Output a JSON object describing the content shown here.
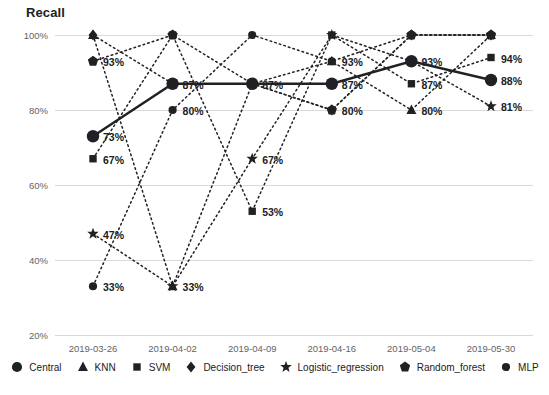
{
  "chart_data": {
    "type": "line",
    "title": "Recall",
    "xlabel": "",
    "ylabel": "",
    "ylim": [
      20,
      100
    ],
    "yticks": [
      "20%",
      "40%",
      "60%",
      "80%",
      "100%"
    ],
    "ytick_values": [
      20,
      40,
      60,
      80,
      100
    ],
    "grid": true,
    "legend_position": "bottom",
    "categories": [
      "2019-03-26",
      "2019-04-02",
      "2019-04-09",
      "2019-04-16",
      "2019-05-04",
      "2019-05-30"
    ],
    "series": [
      {
        "name": "Central",
        "marker": "circle",
        "line": "solid",
        "emphasis": true,
        "values": [
          73,
          87,
          87,
          87,
          93,
          88
        ],
        "labels": [
          "73%",
          "87%",
          "87%",
          "87%",
          "93%",
          "88%"
        ]
      },
      {
        "name": "KNN",
        "marker": "triangle",
        "line": "dotted",
        "emphasis": false,
        "values": [
          100,
          33,
          87,
          93,
          80,
          100
        ],
        "labels": [
          "",
          "",
          "",
          "",
          "80%",
          ""
        ]
      },
      {
        "name": "SVM",
        "marker": "square",
        "line": "dotted",
        "emphasis": false,
        "values": [
          67,
          100,
          53,
          100,
          87,
          94
        ],
        "labels": [
          "67%",
          "",
          "53%",
          "",
          "87%",
          "94%"
        ]
      },
      {
        "name": "Decision_tree",
        "marker": "diamond",
        "line": "dotted",
        "emphasis": false,
        "values": [
          100,
          87,
          87,
          80,
          100,
          100
        ],
        "labels": [
          "",
          "",
          "",
          "",
          "",
          ""
        ]
      },
      {
        "name": "Logistic_regression",
        "marker": "star",
        "line": "dotted",
        "emphasis": false,
        "values": [
          47,
          33,
          67,
          100,
          93,
          81
        ],
        "labels": [
          "47%",
          "33%",
          "67%",
          "",
          "",
          "81%"
        ]
      },
      {
        "name": "Random_forest",
        "marker": "pentagon",
        "line": "dotted",
        "emphasis": false,
        "values": [
          93,
          100,
          87,
          80,
          100,
          100
        ],
        "labels": [
          "93%",
          "",
          "",
          "80%",
          "",
          ""
        ]
      },
      {
        "name": "MLP",
        "marker": "circle-small",
        "line": "dotted",
        "emphasis": false,
        "values": [
          33,
          80,
          100,
          93,
          100,
          100
        ],
        "labels": [
          "33%",
          "80%",
          "",
          "93%",
          "",
          ""
        ]
      }
    ],
    "annotations": [
      {
        "text": "100%",
        "axis": "y"
      },
      {
        "text": "80%",
        "axis": "y"
      },
      {
        "text": "60%",
        "axis": "y"
      },
      {
        "text": "40%",
        "axis": "y"
      },
      {
        "text": "20%",
        "axis": "y"
      }
    ]
  },
  "colors": {
    "ink": "#202124",
    "grid": "#d9d9d9",
    "tick_text": "#5f6368",
    "background": "#ffffff"
  },
  "legend": {
    "items": [
      {
        "label": "Central",
        "marker": "circle"
      },
      {
        "label": "KNN",
        "marker": "triangle"
      },
      {
        "label": "SVM",
        "marker": "square"
      },
      {
        "label": "Decision_tree",
        "marker": "diamond"
      },
      {
        "label": "Logistic_regression",
        "marker": "star"
      },
      {
        "label": "Random_forest",
        "marker": "pentagon"
      },
      {
        "label": "MLP",
        "marker": "circle-small"
      }
    ]
  }
}
